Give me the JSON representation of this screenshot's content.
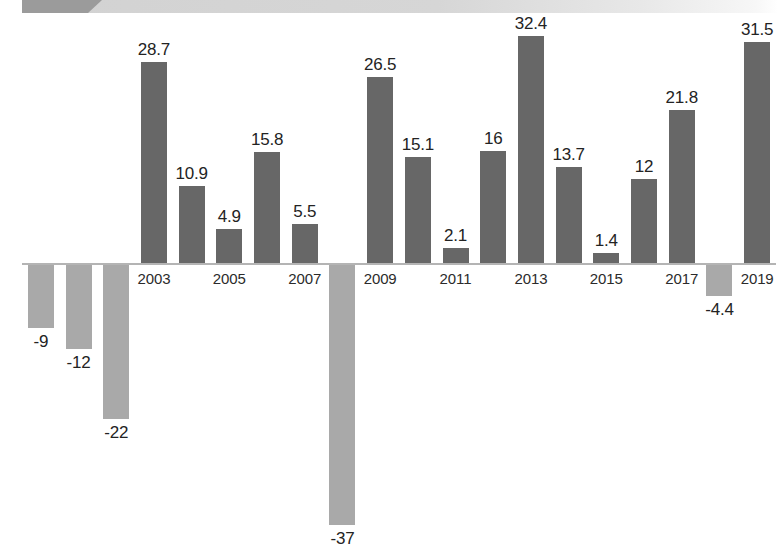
{
  "banner": {
    "accent_color": "#9b9b9b",
    "strip_color": "#d4d4d4"
  },
  "colors": {
    "positive_bar": "#676767",
    "negative_bar": "#a9a9a9",
    "axis_line": "#b4b4b4",
    "label_text": "#232323",
    "background": "#ffffff"
  },
  "chart_data": {
    "type": "bar",
    "title": "",
    "subtitle": "",
    "xlabel": "",
    "ylabel": "",
    "grid": false,
    "legend": null,
    "axis_zero_line": true,
    "categories": [
      "2000",
      "2001",
      "2002",
      "2003",
      "2004",
      "2005",
      "2006",
      "2007",
      "2008",
      "2009",
      "2010",
      "2011",
      "2012",
      "2013",
      "2014",
      "2015",
      "2016",
      "2017",
      "2018",
      "2019"
    ],
    "tick_labels_shown": [
      "2003",
      "2005",
      "2007",
      "2009",
      "2011",
      "2013",
      "2015",
      "2017",
      "2019"
    ],
    "values": [
      -9,
      -12,
      -22,
      28.7,
      10.9,
      4.9,
      15.8,
      5.5,
      -37,
      26.5,
      15.1,
      2.1,
      16,
      32.4,
      13.7,
      1.4,
      12,
      21.8,
      -4.4,
      31.5
    ],
    "data_labels": [
      "-9",
      "-12",
      "-22",
      "28.7",
      "10.9",
      "4.9",
      "15.8",
      "5.5",
      "-37",
      "26.5",
      "15.1",
      "2.1",
      "16",
      "32.4",
      "13.7",
      "1.4",
      "12",
      "21.8",
      "-4.4",
      "31.5"
    ],
    "ylim": [
      -40,
      36
    ],
    "series": [
      {
        "name": "Annual change",
        "values": [
          -9,
          -12,
          -22,
          28.7,
          10.9,
          4.9,
          15.8,
          5.5,
          -37,
          26.5,
          15.1,
          2.1,
          16,
          32.4,
          13.7,
          1.4,
          12,
          21.8,
          -4.4,
          31.5
        ]
      }
    ]
  }
}
